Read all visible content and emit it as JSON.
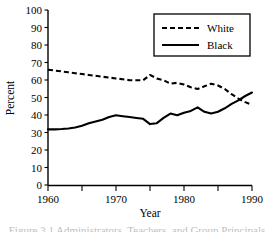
{
  "figure": {
    "caption": "Figure 3.1   Administrators, Teachers, and Group Principals"
  },
  "chart_data": {
    "type": "line",
    "title": "",
    "xlabel": "Year",
    "ylabel": "Percent",
    "xlim": [
      1960,
      1990
    ],
    "ylim": [
      0,
      100
    ],
    "xticks": [
      1960,
      1965,
      1970,
      1975,
      1980,
      1985,
      1990
    ],
    "xtick_labels": [
      "1960",
      "",
      "1970",
      "",
      "1980",
      "",
      "1990"
    ],
    "yticks": [
      0,
      10,
      20,
      30,
      40,
      50,
      60,
      70,
      80,
      90,
      100
    ],
    "ytick_labels": [
      "0",
      "10",
      "20",
      "30",
      "40",
      "50",
      "60",
      "70",
      "80",
      "90",
      "100"
    ],
    "grid": false,
    "legend_position": "top-right",
    "x": [
      1960,
      1961,
      1962,
      1963,
      1964,
      1965,
      1966,
      1967,
      1968,
      1969,
      1970,
      1971,
      1972,
      1973,
      1974,
      1975,
      1976,
      1977,
      1978,
      1979,
      1980,
      1981,
      1982,
      1983,
      1984,
      1985,
      1986,
      1987,
      1988,
      1989,
      1990
    ],
    "series": [
      {
        "name": "White",
        "style": "dashed",
        "color": "#000000",
        "values": [
          66,
          65.5,
          65,
          64.5,
          64,
          63.5,
          63,
          62.5,
          62,
          61.5,
          61,
          60.5,
          60,
          60,
          60,
          63,
          61,
          60,
          58,
          58.5,
          57.5,
          56,
          55,
          56.5,
          58,
          57,
          55,
          52,
          49.5,
          47.5,
          46
        ]
      },
      {
        "name": "Black",
        "style": "solid",
        "color": "#000000",
        "values": [
          32,
          32,
          32.2,
          32.5,
          33,
          34,
          35.5,
          36.5,
          37.5,
          39,
          40,
          39.5,
          39,
          38.5,
          38,
          35,
          35.5,
          38.5,
          41,
          40,
          41.5,
          42.5,
          44.5,
          42,
          41,
          42,
          44,
          46.5,
          48.5,
          51,
          53
        ]
      }
    ],
    "legend": [
      {
        "label": "White",
        "style": "dashed"
      },
      {
        "label": "Black",
        "style": "solid"
      }
    ]
  }
}
